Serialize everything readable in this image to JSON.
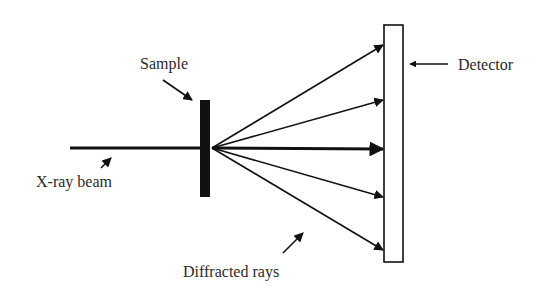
{
  "diagram": {
    "labels": {
      "sample": "Sample",
      "xray_beam": "X-ray beam",
      "detector": "Detector",
      "diffracted_rays": "Diffracted rays"
    },
    "colors": {
      "stroke": "#111111",
      "text": "#2a2a2a",
      "background": "#ffffff"
    },
    "components": [
      {
        "id": "xray-beam",
        "type": "incident-beam"
      },
      {
        "id": "sample",
        "type": "sample-plate"
      },
      {
        "id": "diffracted-rays",
        "type": "ray-fan",
        "count": 5
      },
      {
        "id": "detector",
        "type": "flat-detector"
      }
    ]
  }
}
